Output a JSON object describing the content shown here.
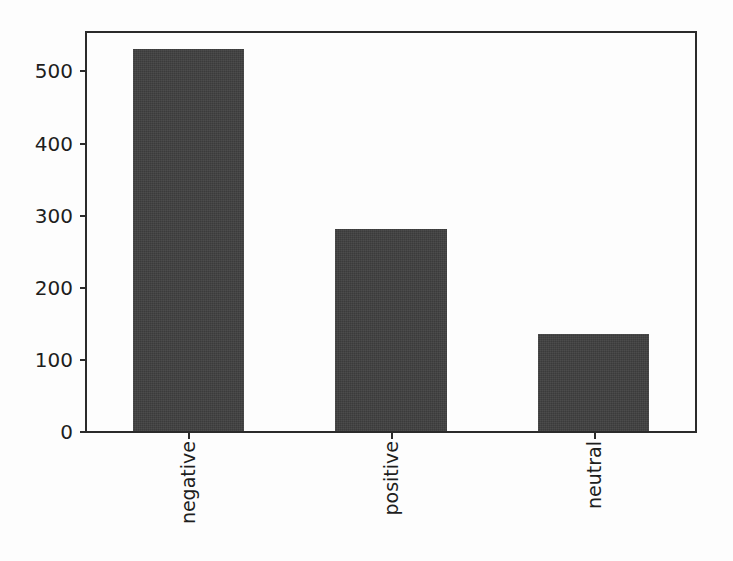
{
  "chart_data": {
    "type": "bar",
    "title": "",
    "subtitle": "",
    "xlabel": "",
    "ylabel": "",
    "categories": [
      "negative",
      "positive",
      "neutral"
    ],
    "values": [
      530,
      280,
      135
    ],
    "series": [
      {
        "name": "count",
        "values": [
          530,
          280,
          135
        ]
      }
    ],
    "ylim": [
      0,
      552
    ],
    "xlim": [
      -0.5,
      2.5
    ],
    "yticks": [
      0,
      100,
      200,
      300,
      400,
      500
    ],
    "ytick_labels": [
      "0",
      "100",
      "200",
      "300",
      "400",
      "500"
    ],
    "xtick_labels": [
      "negative",
      "positive",
      "neutral"
    ],
    "xtick_label_rotation": 90,
    "grid": false,
    "legend": false,
    "legend_position": "none",
    "bar_color": "#3f3f3f",
    "axes_color": "#2b2b2b",
    "background_color": "#fdfdfd",
    "bar_width_fraction": 0.55
  }
}
